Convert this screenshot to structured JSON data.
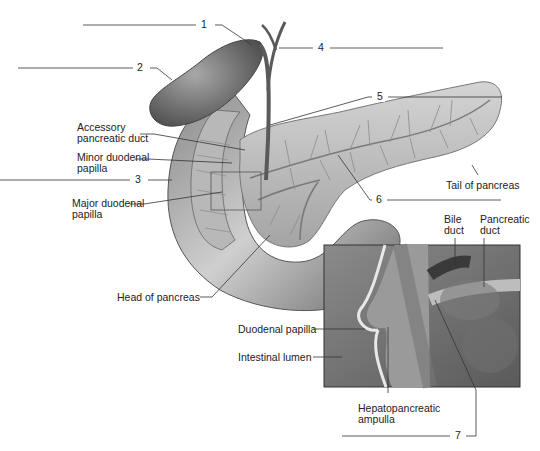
{
  "figure": {
    "numbered_callouts": [
      {
        "id": 1,
        "label": "1"
      },
      {
        "id": 2,
        "label": "2"
      },
      {
        "id": 3,
        "label": "3"
      },
      {
        "id": 4,
        "label": "4"
      },
      {
        "id": 5,
        "label": "5"
      },
      {
        "id": 6,
        "label": "6"
      },
      {
        "id": 7,
        "label": "7"
      }
    ],
    "labels": {
      "accessory_pancreatic_duct": [
        "Accessory",
        "pancreatic duct"
      ],
      "minor_duodenal_papilla": [
        "Minor duodenal",
        "papilla"
      ],
      "major_duodenal_papilla": [
        "Major duodenal",
        "papilla"
      ],
      "tail_of_pancreas": "Tail of pancreas",
      "head_of_pancreas": "Head of pancreas",
      "bile_duct": [
        "Bile",
        "duct"
      ],
      "pancreatic_duct": [
        "Pancreatic",
        "duct"
      ],
      "duodenal_papilla": "Duodenal papilla",
      "intestinal_lumen": "Intestinal lumen",
      "hepatopancreatic_ampulla": [
        "Hepatopancreatic",
        "ampulla"
      ]
    },
    "colors": {
      "line": "#333333",
      "tissue_dark": "#6f6f6f",
      "tissue_mid": "#9a9a9a",
      "tissue_light": "#c8c8c8",
      "background": "#ffffff"
    }
  }
}
